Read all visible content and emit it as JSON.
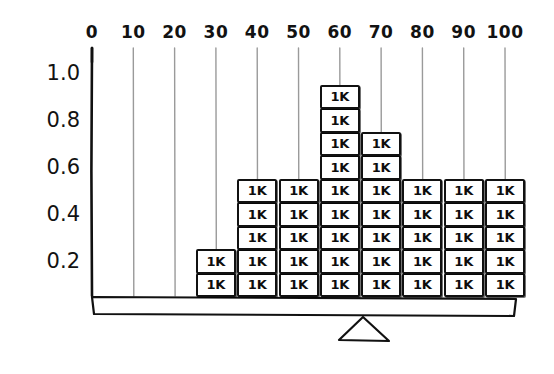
{
  "chart_data": {
    "type": "bar",
    "title": "",
    "subtitle": "",
    "xlabel": "",
    "ylabel": "",
    "style": "hand-drawn stacked unit blocks on a balance beam",
    "unit_block_label": "1K",
    "unit_block_value": 0.1,
    "categories": [
      0,
      10,
      20,
      30,
      40,
      50,
      60,
      70,
      80,
      90,
      100
    ],
    "x_tick_labels": [
      "0",
      "10",
      "20",
      "30",
      "40",
      "50",
      "60",
      "70",
      "80",
      "90",
      "100"
    ],
    "y_tick_labels": [
      "1.0",
      "0.8",
      "0.6",
      "0.4",
      "0.2"
    ],
    "y_tick_values": [
      1.0,
      0.8,
      0.6,
      0.4,
      0.2
    ],
    "xlim": [
      0,
      100
    ],
    "ylim": [
      0,
      1.1
    ],
    "grid": true,
    "grid_orientation": "vertical",
    "legend": "none",
    "block_counts": [
      0,
      0,
      0,
      2,
      5,
      5,
      9,
      7,
      5,
      5,
      5
    ],
    "values": [
      0,
      0,
      0,
      0.2,
      0.5,
      0.5,
      0.9,
      0.7,
      0.5,
      0.5,
      0.5
    ],
    "bars": [
      {
        "category": "0",
        "blocks": 0,
        "value": 0.0
      },
      {
        "category": "10",
        "blocks": 0,
        "value": 0.0
      },
      {
        "category": "20",
        "blocks": 0,
        "value": 0.0
      },
      {
        "category": "30",
        "blocks": 2,
        "value": 0.2
      },
      {
        "category": "40",
        "blocks": 5,
        "value": 0.5
      },
      {
        "category": "50",
        "blocks": 5,
        "value": 0.5
      },
      {
        "category": "60",
        "blocks": 9,
        "value": 0.9
      },
      {
        "category": "70",
        "blocks": 7,
        "value": 0.7
      },
      {
        "category": "80",
        "blocks": 5,
        "value": 0.5
      },
      {
        "category": "90",
        "blocks": 5,
        "value": 0.5
      },
      {
        "category": "100",
        "blocks": 5,
        "value": 0.5
      }
    ],
    "annotations": [
      {
        "name": "balance-beam",
        "description": "horizontal beam beneath the block stacks"
      },
      {
        "name": "fulcrum-triangle",
        "description": "triangle pivot under the beam near x=60"
      }
    ],
    "colors": {
      "ink": "#111111",
      "grid": "#9a9a9a",
      "block_fill": "#ffffff",
      "background": "#ffffff"
    }
  },
  "geometry": {
    "axis_x": 92,
    "axis_top": 48,
    "axis_bottom": 296,
    "tick_spacing": 41.3,
    "block_width": 40,
    "block_height": 23.5,
    "beam_left": 92,
    "beam_right": 512,
    "beam_top": 296,
    "beam_bottom": 316,
    "fulcrum_apex_x": 363,
    "fulcrum_base_left": 339,
    "fulcrum_base_right": 389,
    "fulcrum_base_y": 341
  }
}
